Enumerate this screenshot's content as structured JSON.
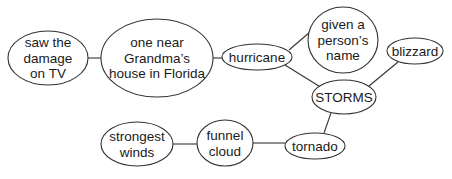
{
  "diagram": {
    "type": "web / cluster map",
    "center_node": "STORMS",
    "nodes": [
      {
        "id": "tv",
        "lines": [
          "saw the",
          "damage",
          "on TV"
        ],
        "cx": 48,
        "cy": 58,
        "rx": 40,
        "ry": 27
      },
      {
        "id": "grandma",
        "lines": [
          "one near",
          "Grandma’s",
          "house in Florida"
        ],
        "cx": 157,
        "cy": 58,
        "rx": 56,
        "ry": 39
      },
      {
        "id": "hurricane",
        "lines": [
          "hurricane"
        ],
        "cx": 257,
        "cy": 57,
        "rx": 35,
        "ry": 13
      },
      {
        "id": "name",
        "lines": [
          "given a",
          "person’s",
          "name"
        ],
        "cx": 343,
        "cy": 40,
        "rx": 35,
        "ry": 33
      },
      {
        "id": "blizzard",
        "lines": [
          "blizzard"
        ],
        "cx": 415,
        "cy": 51,
        "rx": 28,
        "ry": 13
      },
      {
        "id": "storms",
        "lines": [
          "STORMS"
        ],
        "cx": 344,
        "cy": 97,
        "rx": 32,
        "ry": 17
      },
      {
        "id": "winds",
        "lines": [
          "strongest",
          "winds"
        ],
        "cx": 137,
        "cy": 144,
        "rx": 36,
        "ry": 22
      },
      {
        "id": "funnel",
        "lines": [
          "funnel",
          "cloud"
        ],
        "cx": 225,
        "cy": 143,
        "rx": 28,
        "ry": 23
      },
      {
        "id": "tornado",
        "lines": [
          "tornado"
        ],
        "cx": 315,
        "cy": 146,
        "rx": 30,
        "ry": 13
      }
    ],
    "edges": [
      {
        "from": "tv",
        "to": "grandma",
        "x1": 88,
        "y1": 58,
        "x2": 101,
        "y2": 58
      },
      {
        "from": "grandma",
        "to": "hurricane",
        "x1": 213,
        "y1": 58,
        "x2": 222,
        "y2": 58
      },
      {
        "from": "hurricane",
        "to": "name",
        "x1": 289,
        "y1": 50,
        "x2": 310,
        "y2": 32
      },
      {
        "from": "hurricane",
        "to": "storms",
        "x1": 285,
        "y1": 65,
        "x2": 322,
        "y2": 88
      },
      {
        "from": "blizzard",
        "to": "storms",
        "x1": 398,
        "y1": 62,
        "x2": 369,
        "y2": 86
      },
      {
        "from": "storms",
        "to": "tornado",
        "x1": 331,
        "y1": 113,
        "x2": 324,
        "y2": 133
      },
      {
        "from": "winds",
        "to": "funnel",
        "x1": 173,
        "y1": 144,
        "x2": 197,
        "y2": 144
      },
      {
        "from": "funnel",
        "to": "tornado",
        "x1": 253,
        "y1": 143,
        "x2": 285,
        "y2": 143
      }
    ]
  },
  "colors": {
    "stroke": "#333333",
    "text": "#1a1a1a",
    "background": "#ffffff"
  }
}
